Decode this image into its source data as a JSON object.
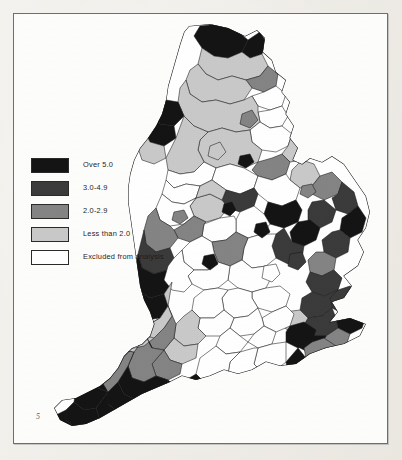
{
  "figure": {
    "page_marker": "5",
    "background_color": "#f2f0ec",
    "plate_background": "#fdfdfc",
    "frame_color": "#6e6e6e"
  },
  "legend": {
    "items": [
      {
        "label": "Over 5.0",
        "color": "#141414",
        "class_name": "over-5-0"
      },
      {
        "label": "3.0-4.9",
        "color": "#3b3b3b",
        "class_name": "3-0-to-4-9"
      },
      {
        "label": "2.0-2.9",
        "color": "#848484",
        "class_name": "2-0-to-2-9"
      },
      {
        "label": "Less than 2.0",
        "color": "#c9c9c9",
        "class_name": "less-than-2-0"
      },
      {
        "label": "Excluded from analysis",
        "color": "#ffffff",
        "class_name": "excluded"
      }
    ]
  },
  "map": {
    "region_name": "England",
    "stroke_color": "#1a1a1a",
    "note": "District-level choropleth of England; Wales and Scotland are outside the mapped area.",
    "areas": [
      {
        "name": "Northumberland north",
        "class": "over-5-0"
      },
      {
        "name": "Berwick",
        "class": "over-5-0"
      },
      {
        "name": "Tynedale",
        "class": "less-than-2-0"
      },
      {
        "name": "Cumbria north",
        "class": "less-than-2-0"
      },
      {
        "name": "Carlisle",
        "class": "less-than-2-0"
      },
      {
        "name": "Allerdale",
        "class": "over-5-0"
      },
      {
        "name": "Copeland",
        "class": "over-5-0"
      },
      {
        "name": "Tyneside",
        "class": "excluded"
      },
      {
        "name": "Durham",
        "class": "less-than-2-0"
      },
      {
        "name": "Teesside",
        "class": "excluded"
      },
      {
        "name": "North Yorkshire moors",
        "class": "over-5-0"
      },
      {
        "name": "Richmondshire",
        "class": "2-0-to-2-9"
      },
      {
        "name": "Yorkshire Dales",
        "class": "less-than-2-0"
      },
      {
        "name": "West Yorkshire",
        "class": "excluded"
      },
      {
        "name": "South Yorkshire",
        "class": "excluded"
      },
      {
        "name": "Humberside",
        "class": "2-0-to-2-9"
      },
      {
        "name": "Lincolnshire coast",
        "class": "over-5-0"
      },
      {
        "name": "Lincolnshire wolds",
        "class": "3-0-to-4-9"
      },
      {
        "name": "Greater Manchester",
        "class": "excluded"
      },
      {
        "name": "Merseyside",
        "class": "excluded"
      },
      {
        "name": "Cheshire",
        "class": "less-than-2-0"
      },
      {
        "name": "Staffordshire",
        "class": "3-0-to-4-9"
      },
      {
        "name": "Shropshire",
        "class": "2-0-to-2-9"
      },
      {
        "name": "West Midlands",
        "class": "excluded"
      },
      {
        "name": "Herefordshire",
        "class": "over-5-0"
      },
      {
        "name": "Worcestershire",
        "class": "less-than-2-0"
      },
      {
        "name": "Derbyshire Peak",
        "class": "3-0-to-4-9"
      },
      {
        "name": "Nottinghamshire",
        "class": "excluded"
      },
      {
        "name": "Leicestershire",
        "class": "less-than-2-0"
      },
      {
        "name": "Northamptonshire",
        "class": "2-0-to-2-9"
      },
      {
        "name": "Norfolk north",
        "class": "3-0-to-4-9"
      },
      {
        "name": "Norfolk broads",
        "class": "over-5-0"
      },
      {
        "name": "Suffolk coastal",
        "class": "3-0-to-4-9"
      },
      {
        "name": "Suffolk inland",
        "class": "2-0-to-2-9"
      },
      {
        "name": "Cambridgeshire fens",
        "class": "3-0-to-4-9"
      },
      {
        "name": "Essex coast",
        "class": "over-5-0"
      },
      {
        "name": "Essex inland",
        "class": "excluded"
      },
      {
        "name": "Greater London",
        "class": "excluded"
      },
      {
        "name": "Hertfordshire",
        "class": "excluded"
      },
      {
        "name": "Buckinghamshire",
        "class": "excluded"
      },
      {
        "name": "Oxfordshire",
        "class": "less-than-2-0"
      },
      {
        "name": "Gloucestershire",
        "class": "2-0-to-2-9"
      },
      {
        "name": "Wiltshire",
        "class": "less-than-2-0"
      },
      {
        "name": "Somerset",
        "class": "2-0-to-2-9"
      },
      {
        "name": "Avon",
        "class": "excluded"
      },
      {
        "name": "Dorset",
        "class": "over-5-0"
      },
      {
        "name": "Devon north",
        "class": "over-5-0"
      },
      {
        "name": "Devon mid",
        "class": "less-than-2-0"
      },
      {
        "name": "Dartmoor",
        "class": "2-0-to-2-9"
      },
      {
        "name": "Devon south",
        "class": "over-5-0"
      },
      {
        "name": "Cornwall north",
        "class": "over-5-0"
      },
      {
        "name": "Cornwall west",
        "class": "over-5-0"
      },
      {
        "name": "Hampshire",
        "class": "over-5-0"
      },
      {
        "name": "Isle of Wight",
        "class": "over-5-0"
      },
      {
        "name": "West Sussex",
        "class": "over-5-0"
      },
      {
        "name": "East Sussex",
        "class": "over-5-0"
      },
      {
        "name": "Kent weald",
        "class": "over-5-0"
      },
      {
        "name": "Kent coast",
        "class": "2-0-to-2-9"
      },
      {
        "name": "Surrey",
        "class": "excluded"
      }
    ]
  }
}
